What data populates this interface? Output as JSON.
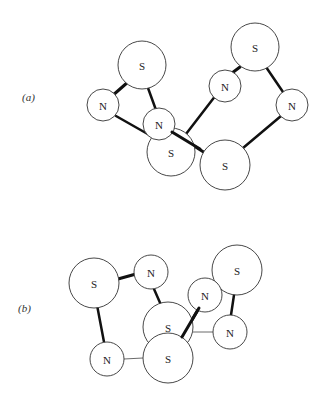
{
  "panels": [
    {
      "label": "(a)",
      "atoms": [
        {
          "id": "a_S1",
          "el": "S",
          "cx": 142,
          "cy": 65,
          "r": 24
        },
        {
          "id": "a_N1",
          "el": "N",
          "cx": 103,
          "cy": 105,
          "r": 16
        },
        {
          "id": "a_N2",
          "el": "N",
          "cx": 159,
          "cy": 124,
          "r": 16
        },
        {
          "id": "a_S2",
          "el": "S",
          "cx": 171,
          "cy": 152,
          "r": 24
        },
        {
          "id": "a_N3",
          "el": "N",
          "cx": 225,
          "cy": 86,
          "r": 16
        },
        {
          "id": "a_S3",
          "el": "S",
          "cx": 255,
          "cy": 47,
          "r": 24
        },
        {
          "id": "a_N4",
          "el": "N",
          "cx": 292,
          "cy": 105,
          "r": 16
        },
        {
          "id": "a_S4",
          "el": "S",
          "cx": 225,
          "cy": 165,
          "r": 25
        }
      ]
    },
    {
      "label": "(b)",
      "atoms": [
        {
          "id": "b_S1",
          "el": "S",
          "cx": 94,
          "cy": 283,
          "r": 25
        },
        {
          "id": "b_N1",
          "el": "N",
          "cx": 151,
          "cy": 272,
          "r": 17
        },
        {
          "id": "b_S2",
          "el": "S",
          "cx": 168,
          "cy": 327,
          "r": 25
        },
        {
          "id": "b_S3",
          "el": "S",
          "cx": 168,
          "cy": 358,
          "r": 25
        },
        {
          "id": "b_N2",
          "el": "N",
          "cx": 107,
          "cy": 359,
          "r": 17
        },
        {
          "id": "b_N3",
          "el": "N",
          "cx": 205,
          "cy": 295,
          "r": 17
        },
        {
          "id": "b_S4",
          "el": "S",
          "cx": 237,
          "cy": 270,
          "r": 25
        },
        {
          "id": "b_N4",
          "el": "N",
          "cx": 230,
          "cy": 332,
          "r": 17
        }
      ]
    }
  ]
}
